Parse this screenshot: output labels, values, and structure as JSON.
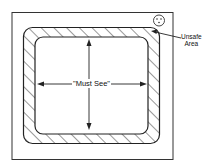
{
  "diagram": {
    "labels": {
      "center": "\"Must See\"",
      "unsafe_line1": "Unsafe",
      "unsafe_line2": "Area"
    },
    "elements": {
      "outer_frame": "screen bezel",
      "hatched_band": "unsafe area border",
      "inner_area": "must-see safe area",
      "control_knob": "knob icon top-right"
    },
    "colors": {
      "stroke": "#222222",
      "background": "#ffffff"
    }
  }
}
